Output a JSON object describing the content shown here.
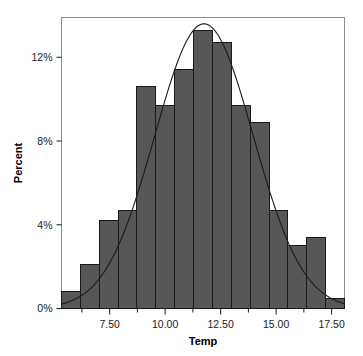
{
  "chart_data": {
    "type": "bar",
    "title": "",
    "subtitle": "",
    "xlabel": "Temp",
    "ylabel": "Percent",
    "categories": [
      "5.75",
      "6.60",
      "7.45",
      "8.30",
      "9.15",
      "10.00",
      "10.85",
      "11.70",
      "12.55",
      "13.40",
      "14.25",
      "15.10",
      "15.95",
      "16.80",
      "17.65"
    ],
    "bin_edges": [
      5.33,
      6.18,
      7.03,
      7.88,
      8.73,
      9.58,
      10.43,
      11.28,
      12.13,
      12.98,
      13.83,
      14.68,
      15.53,
      16.38,
      17.23,
      18.08
    ],
    "values": [
      0.8,
      2.1,
      4.2,
      4.7,
      10.6,
      9.7,
      11.4,
      13.3,
      12.7,
      9.7,
      8.9,
      4.7,
      3.0,
      3.4,
      0.5
    ],
    "values_unit": "%",
    "xlim": [
      5.33,
      18.08
    ],
    "ylim": [
      0,
      13.9
    ],
    "x_tick_labels": [
      "7.50",
      "10.00",
      "12.50",
      "15.00",
      "17.50"
    ],
    "x_tick_values": [
      7.5,
      10.0,
      12.5,
      15.0,
      17.5
    ],
    "x_minor_ticks": [
      6.25,
      8.75,
      11.25,
      13.75,
      16.25
    ],
    "y_tick_labels": [
      "0%",
      "4%",
      "8%",
      "12%"
    ],
    "y_tick_values": [
      0,
      4,
      8,
      12
    ],
    "grid": false,
    "legend": null,
    "overlay": {
      "name": "normal-density-curve",
      "type": "line",
      "mean": 11.75,
      "sigma": 2.22,
      "peak_percent": 13.6
    },
    "colors": {
      "bar_fill": "#575757",
      "bar_edge": "#1a1a1a",
      "curve": "#1a1a1a",
      "frame": "#8c8c8c",
      "axis_text": "#1a1a1a",
      "background": "#ffffff"
    }
  }
}
